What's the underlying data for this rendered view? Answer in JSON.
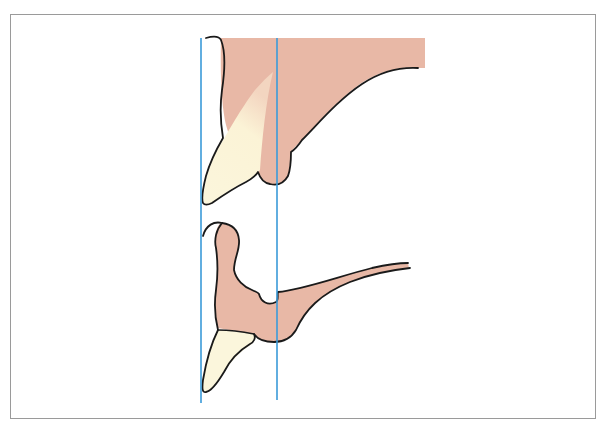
{
  "figure": {
    "colors": {
      "tissue": "#e8b8a6",
      "tooth": "#fbf6dc",
      "outline": "#1a1a1a",
      "reference_line": "#3a9ad9",
      "frame": "#9a9a9a",
      "background": "#ffffff"
    },
    "elements": [
      {
        "name": "upper-jaw",
        "parts": [
          "gingiva",
          "canine-crown"
        ]
      },
      {
        "name": "lower-jaw",
        "parts": [
          "gingiva",
          "canine-crown"
        ]
      },
      {
        "name": "reference-line-left"
      },
      {
        "name": "reference-line-right"
      }
    ]
  }
}
